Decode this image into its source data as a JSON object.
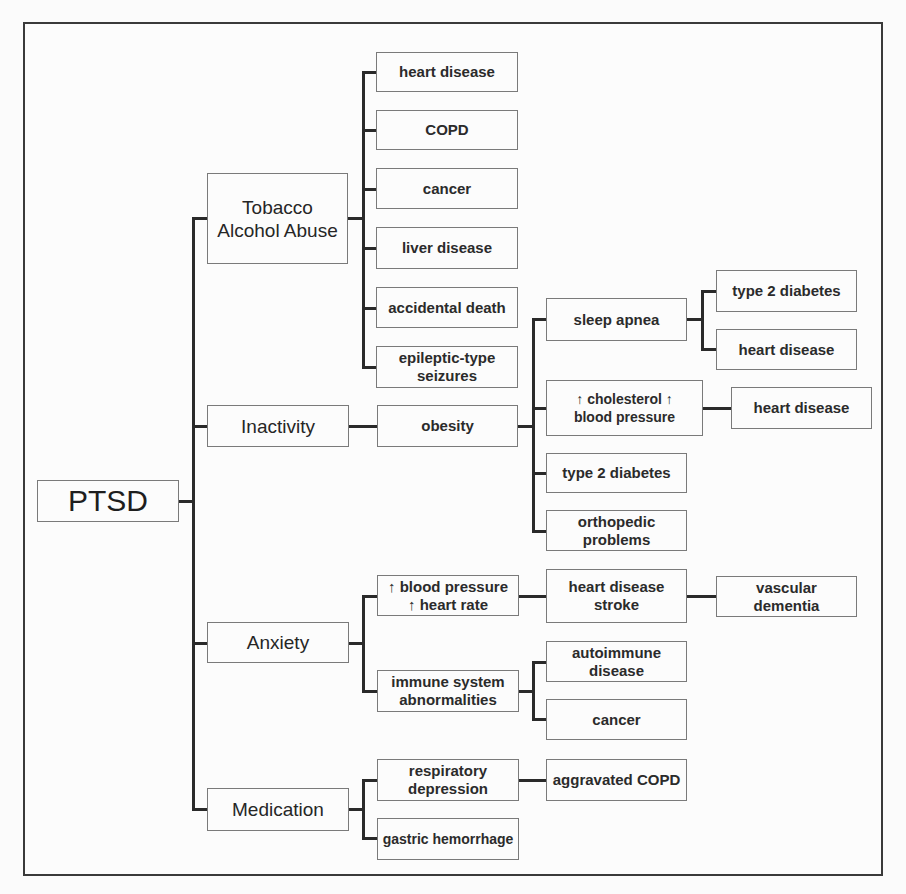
{
  "diagram": {
    "root": "PTSD",
    "level1": {
      "tobacco": "Tobacco\nAlcohol Abuse",
      "inactivity": "Inactivity",
      "anxiety": "Anxiety",
      "medication": "Medication"
    },
    "tobacco_children": [
      "heart disease",
      "COPD",
      "cancer",
      "liver disease",
      "accidental death",
      "epileptic-type\nseizures"
    ],
    "inactivity_children": {
      "obesity": "obesity",
      "obesity_children": {
        "sleep_apnea": "sleep apnea",
        "cholesterol_bp": "↑ cholesterol    ↑\nblood pressure",
        "type2_diabetes": "type 2 diabetes",
        "orthopedic": "orthopedic\nproblems"
      },
      "sleep_apnea_children": [
        "type 2 diabetes",
        "heart disease"
      ],
      "cholesterol_children": [
        "heart disease"
      ]
    },
    "anxiety_children": {
      "bp_hr": "↑ blood pressure\n↑ heart rate",
      "immune": "immune system\nabnormalities",
      "bp_hr_child": "heart disease\nstroke",
      "bp_hr_grandchild": "vascular\ndementia",
      "immune_children": [
        "autoimmune\ndisease",
        "cancer"
      ]
    },
    "medication_children": {
      "respiratory": "respiratory\ndepression",
      "gastric": "gastric hemorrhage",
      "respiratory_child": "aggravated COPD"
    }
  },
  "colors": {
    "line": "#2a2a2a",
    "box_border": "#7a7a7a",
    "background": "#fbfbfb",
    "text": "#2b2b2b"
  }
}
